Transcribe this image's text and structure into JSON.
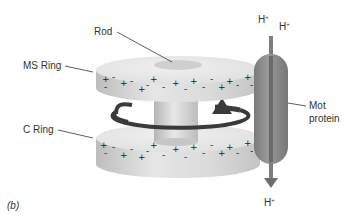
{
  "figure": {
    "panel_label": "(b)",
    "labels": {
      "rod": "Rod",
      "ms_ring": "MS Ring",
      "c_ring": "C Ring",
      "mot_protein_line1": "Mot",
      "mot_protein_line2": "protein"
    },
    "ions": {
      "top_left": {
        "base": "H",
        "charge": "+"
      },
      "top_right": {
        "base": "H",
        "charge": "+"
      },
      "bottom": {
        "base": "H",
        "charge": "+"
      }
    },
    "charges": [
      "+",
      "-"
    ],
    "rotation": "counterclockwise arrow around rod between rings",
    "colors": {
      "ring_top": "#e4e4e4",
      "ring_side": "#d2d2d2",
      "rod_spot": "#c8c8c8",
      "mot_protein": "#8a8a8a",
      "mot_channel": "#6e6e6e",
      "arrow": "#3a3a3a",
      "text": "#333333"
    }
  }
}
